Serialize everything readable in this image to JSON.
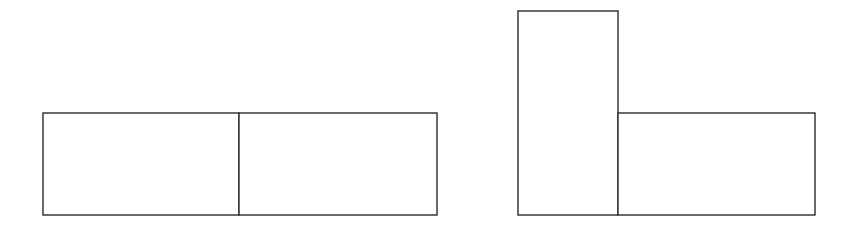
{
  "canvas": {
    "width": 858,
    "height": 225,
    "background": "#ffffff",
    "stroke": "#2b2b2b"
  },
  "figures": [
    {
      "name": "figure-left-horizontal-pair",
      "description": "Two equal rectangles side by side forming a horizontal 2x1 arrangement",
      "rects": [
        {
          "name": "left-rect-a",
          "x": 43,
          "y": 113,
          "w": 196,
          "h": 102
        },
        {
          "name": "left-rect-b",
          "x": 239,
          "y": 113,
          "w": 198,
          "h": 102
        }
      ]
    },
    {
      "name": "figure-right-l-shape",
      "description": "One tall (vertical) rectangle next to one wide (horizontal) rectangle forming an L shape",
      "rects": [
        {
          "name": "right-rect-tall",
          "x": 518,
          "y": 11,
          "w": 100,
          "h": 204
        },
        {
          "name": "right-rect-wide",
          "x": 618,
          "y": 113,
          "w": 197,
          "h": 102
        }
      ]
    }
  ]
}
